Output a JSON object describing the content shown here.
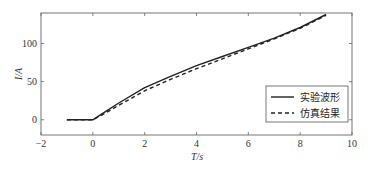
{
  "chart_data": {
    "type": "line",
    "title": "",
    "xlabel": "T/s",
    "ylabel": "I/A",
    "xlim": [
      -2,
      10
    ],
    "ylim": [
      -20,
      140
    ],
    "xticks": [
      -2,
      0,
      2,
      4,
      6,
      8,
      10
    ],
    "yticks": [
      0,
      50,
      100
    ],
    "grid": false,
    "legend_position": "lower right",
    "series": [
      {
        "name": "实验波形",
        "style": "solid",
        "color": "#222222",
        "x": [
          -1,
          0,
          0.5,
          1,
          2,
          3,
          4,
          5,
          6,
          7,
          8,
          9
        ],
        "y": [
          0,
          0,
          11,
          22,
          42,
          57,
          71,
          83,
          95,
          107,
          121,
          138
        ]
      },
      {
        "name": "仿真结果",
        "style": "dashed",
        "color": "#222222",
        "x": [
          -1,
          0,
          0.5,
          1,
          2,
          3,
          4,
          5,
          6,
          7,
          8,
          9
        ],
        "y": [
          0,
          0,
          9,
          19,
          38,
          53,
          67,
          80,
          93,
          106,
          120,
          137
        ]
      }
    ]
  },
  "axes": {
    "xlabel": "T/s",
    "ylabel": "I/A"
  },
  "legend": {
    "items": [
      {
        "label": "实验波形",
        "style": "solid"
      },
      {
        "label": "仿真结果",
        "style": "dashed"
      }
    ]
  }
}
